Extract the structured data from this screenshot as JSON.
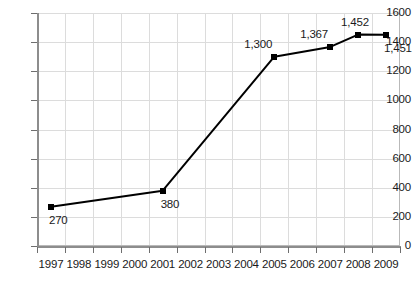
{
  "chart_data": {
    "type": "line",
    "title": "",
    "subtitle": "",
    "xlabel": "",
    "ylabel": "",
    "categories": [
      "1997",
      "1998",
      "1999",
      "2000",
      "2001",
      "2002",
      "2003",
      "2004",
      "2005",
      "2006",
      "2007",
      "2008",
      "2009"
    ],
    "x_tick_labels": [
      "1997",
      "1998",
      "1999",
      "2000",
      "2001",
      "2002",
      "2003",
      "2004",
      "2005",
      "2006",
      "2007",
      "2008",
      "2009"
    ],
    "y_tick_labels": [
      "0",
      "200",
      "400",
      "600",
      "800",
      "1000",
      "1200",
      "1400",
      "1600"
    ],
    "y_ticks": [
      0,
      200,
      400,
      600,
      800,
      1000,
      1200,
      1400,
      1600
    ],
    "ylim": [
      0,
      1600
    ],
    "grid": true,
    "legend": "none",
    "series": [
      {
        "name": "",
        "color": "#000000",
        "marker": "square",
        "points": [
          {
            "x": "1997",
            "y": 270,
            "label": "270",
            "label_pos": "below-right"
          },
          {
            "x": "2001",
            "y": 380,
            "label": "380",
            "label_pos": "below-right"
          },
          {
            "x": "2005",
            "y": 1300,
            "label": "1,300",
            "label_pos": "above-left"
          },
          {
            "x": "2007",
            "y": 1367,
            "label": "1,367",
            "label_pos": "above-left"
          },
          {
            "x": "2008",
            "y": 1452,
            "label": "1,452",
            "label_pos": "above"
          },
          {
            "x": "2009",
            "y": 1451,
            "label": "1,451",
            "label_pos": "below-right"
          }
        ]
      }
    ]
  },
  "style": {
    "background": "#ffffff",
    "line_color": "#000000",
    "grid_color": "#dcdcdc",
    "axis_color": "#8d8d8d",
    "text_color": "#1a1a1a"
  }
}
